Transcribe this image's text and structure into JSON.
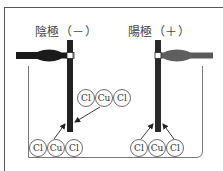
{
  "electrodes": {
    "cathode": {
      "label": "陰極（－）",
      "sign": "－",
      "color": "#222222",
      "clip_color": "#1a1a1a"
    },
    "anode": {
      "label": "陽極（＋）",
      "sign": "＋",
      "color": "#2a2a2a",
      "clip_color": "#666666"
    }
  },
  "cathode_side": {
    "upper_molecule": [
      "Cl",
      "Cu",
      "Cl"
    ],
    "lower_molecule": [
      "Cl",
      "Cu",
      "Cl"
    ]
  },
  "anode_side": {
    "lower_molecule": [
      "Cl",
      "Cu",
      "Cl"
    ]
  },
  "atoms": {
    "c1": "Cl",
    "c2": "Cu",
    "c3": "Cl",
    "c4": "Cl",
    "c5": "Cu",
    "c6": "Cl",
    "c7": "Cl",
    "c8": "Cu",
    "c9": "Cl"
  }
}
